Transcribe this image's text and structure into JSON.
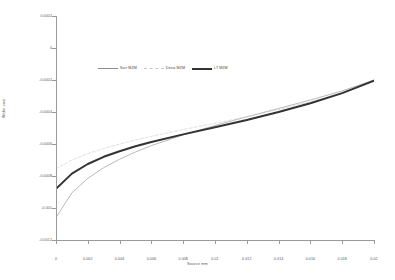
{
  "chart_data": {
    "type": "line",
    "title": "",
    "xlabel": "Source mm",
    "ylabel": "Wafer cost",
    "xlim": [
      0,
      0.02
    ],
    "ylim": [
      -0.0012,
      0.0002
    ],
    "grid": false,
    "legend_position": "upper center",
    "xticks": [
      "0",
      "0.002",
      "0.004",
      "0.006",
      "0.008",
      "0.01",
      "0.012",
      "0.014",
      "0.016",
      "0.018",
      "0.02"
    ],
    "xtick_values": [
      0,
      0.002,
      0.004,
      0.006,
      0.008,
      0.01,
      0.012,
      0.014,
      0.016,
      0.018,
      0.02
    ],
    "yticks": [
      "0.0002",
      "0",
      "-0.0002",
      "-0.0004",
      "-0.0006",
      "-0.0008",
      "-0.001",
      "-0.0012"
    ],
    "ytick_values": [
      0.0002,
      0,
      -0.0002,
      -0.0004,
      -0.0006,
      -0.0008,
      -0.001,
      -0.0012
    ],
    "x": [
      0,
      0.001,
      0.002,
      0.003,
      0.004,
      0.005,
      0.006,
      0.008,
      0.01,
      0.012,
      0.014,
      0.016,
      0.018,
      0.02
    ],
    "series": [
      {
        "name": "Surr MZM",
        "color": "#8c8c8c",
        "style": "solid",
        "width": 0.6,
        "values": [
          -0.00106,
          -0.000905,
          -0.000815,
          -0.000748,
          -0.000695,
          -0.00065,
          -0.00061,
          -0.000543,
          -0.000484,
          -0.00043,
          -0.000378,
          -0.000325,
          -0.000268,
          -0.0002
        ]
      },
      {
        "name": "Devia MZM",
        "color": "#c9c9c9",
        "style": "dashed",
        "width": 0.6,
        "values": [
          -0.000755,
          -0.0007,
          -0.00066,
          -0.000628,
          -0.0006,
          -0.000575,
          -0.000552,
          -0.00051,
          -0.00047,
          -0.00043,
          -0.000385,
          -0.000336,
          -0.00028,
          -0.000208
        ]
      },
      {
        "name": "LT MZM",
        "color": "#333333",
        "style": "solid",
        "width": 2.0,
        "values": [
          -0.00088,
          -0.000785,
          -0.000725,
          -0.00068,
          -0.000645,
          -0.000614,
          -0.000588,
          -0.00054,
          -0.000495,
          -0.00045,
          -0.0004,
          -0.000345,
          -0.000282,
          -0.000205
        ]
      }
    ]
  },
  "legend": {
    "items": [
      {
        "label": "Surr MZM"
      },
      {
        "label": "Devia MZM"
      },
      {
        "label": "LT MZM"
      }
    ]
  }
}
